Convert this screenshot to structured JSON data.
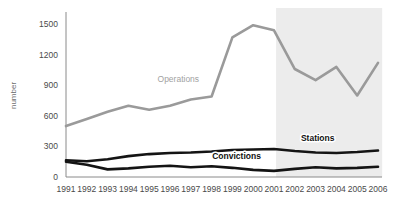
{
  "chart_data": {
    "type": "line",
    "title": "",
    "xlabel": "",
    "ylabel": "number",
    "ylim": [
      0,
      1600
    ],
    "yticks": [
      0,
      300,
      600,
      900,
      1200,
      1500
    ],
    "ytick_labels": [
      "0",
      "300",
      "600",
      "900",
      "1200",
      "1500"
    ],
    "grid": false,
    "legend_position": "inline-labels",
    "categories": [
      "1991",
      "1992",
      "1993",
      "1994",
      "1995",
      "1996",
      "1997",
      "1998",
      "1999",
      "2000",
      "2001",
      "2002",
      "2003",
      "2004",
      "2005",
      "2006"
    ],
    "x": [
      1991,
      1992,
      1993,
      1994,
      1995,
      1996,
      1997,
      1998,
      1999,
      2000,
      2001,
      2002,
      2003,
      2004,
      2005,
      2006
    ],
    "series": [
      {
        "name": "Operations",
        "color": "#9a9a9a",
        "values": [
          500,
          570,
          640,
          700,
          660,
          700,
          760,
          790,
          1370,
          1490,
          1440,
          1060,
          950,
          1080,
          800,
          1120
        ],
        "label_x": 1996.4,
        "label_y": 930
      },
      {
        "name": "Stations",
        "color": "#141414",
        "values": [
          165,
          155,
          175,
          205,
          225,
          235,
          240,
          250,
          265,
          270,
          275,
          255,
          240,
          235,
          245,
          260
        ],
        "label_x": 2003.1,
        "label_y": 355
      },
      {
        "name": "Convictions",
        "color": "#141414",
        "values": [
          150,
          120,
          75,
          85,
          100,
          110,
          95,
          105,
          90,
          70,
          60,
          80,
          95,
          85,
          90,
          100
        ],
        "label_x": 1999.2,
        "label_y": 175
      }
    ],
    "shaded_band": {
      "x_start": 2001.1,
      "x_end": 2006.2,
      "color": "#ececec",
      "note": "light grey background band"
    },
    "annotations": []
  }
}
